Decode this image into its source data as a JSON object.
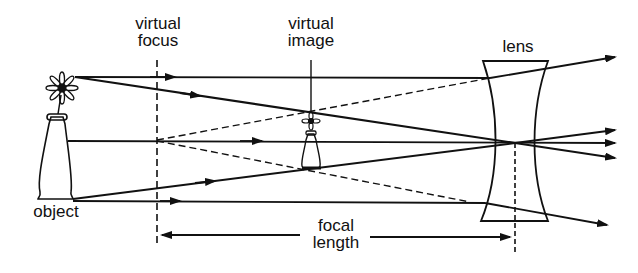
{
  "diagram": {
    "labels": {
      "virtual_focus": [
        "virtual",
        "focus"
      ],
      "virtual_image": [
        "virtual",
        "image"
      ],
      "lens": "lens",
      "object": "object",
      "focal_length": [
        "focal",
        "length"
      ]
    },
    "colors": {
      "ink": "#111111",
      "background": "#ffffff"
    },
    "elements": [
      "object-flower-in-vase",
      "virtual-focus-line",
      "virtual-image-flower",
      "concave-lens",
      "optical-axis",
      "ray-parallel-top",
      "ray-through-center",
      "ray-toward-focus",
      "focal-length-arrow"
    ]
  }
}
